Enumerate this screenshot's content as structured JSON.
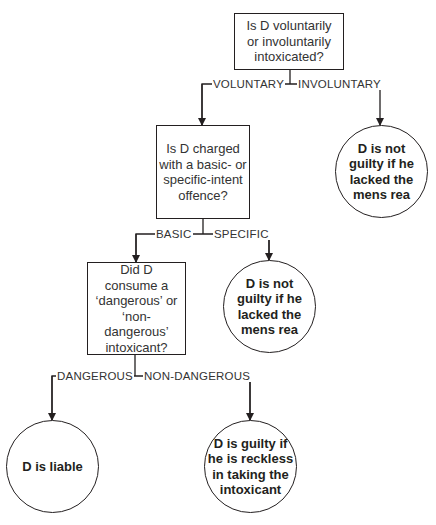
{
  "diagram": {
    "nodes": {
      "q1": {
        "type": "decision",
        "text": "Is D voluntarily\nor involuntarily\nintoxicated?"
      },
      "q2": {
        "type": "decision",
        "text": "Is D charged\nwith a basic- or\nspecific-intent\noffence?"
      },
      "q3": {
        "type": "decision",
        "text": "Did D\nconsume a\n‘dangerous’ or\n‘non-dangerous’\nintoxicant?"
      },
      "o1": {
        "type": "outcome",
        "text": "D is not\nguilty if he\nlacked the\nmens rea"
      },
      "o2": {
        "type": "outcome",
        "text": "D is not\nguilty if he\nlacked the\nmens rea"
      },
      "o3": {
        "type": "outcome",
        "text": "D is liable"
      },
      "o4": {
        "type": "outcome",
        "text": "D is guilty if\nhe is reckless\nin taking the\nintoxicant"
      }
    },
    "edges": {
      "q1_voluntary": {
        "from": "q1",
        "to": "q2",
        "label": "VOLUNTARY"
      },
      "q1_involuntary": {
        "from": "q1",
        "to": "o1",
        "label": "INVOLUNTARY"
      },
      "q2_basic": {
        "from": "q2",
        "to": "q3",
        "label": "BASIC"
      },
      "q2_specific": {
        "from": "q2",
        "to": "o2",
        "label": "SPECIFIC"
      },
      "q3_dangerous": {
        "from": "q3",
        "to": "o3",
        "label": "DANGEROUS"
      },
      "q3_nondangerous": {
        "from": "q3",
        "to": "o4",
        "label": "NON-DANGEROUS"
      }
    },
    "colors": {
      "line": "#231f20",
      "background": "#ffffff"
    }
  }
}
